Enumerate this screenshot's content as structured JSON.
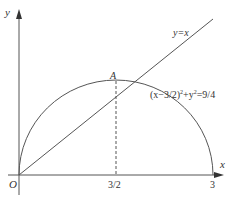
{
  "diagram": {
    "axes": {
      "x_label": "x",
      "y_label": "y",
      "origin_label": "O"
    },
    "ticks": {
      "x_mid": "3/2",
      "x_end": "3"
    },
    "line": {
      "equation": "y=x"
    },
    "circle": {
      "equation_prefix": "(x−3/2)",
      "equation_sup1": "2",
      "equation_mid": "+y",
      "equation_sup2": "2",
      "equation_suffix": "=9/4"
    },
    "point": {
      "label": "A"
    },
    "colors": {
      "stroke": "#555555",
      "text": "#333333"
    }
  }
}
